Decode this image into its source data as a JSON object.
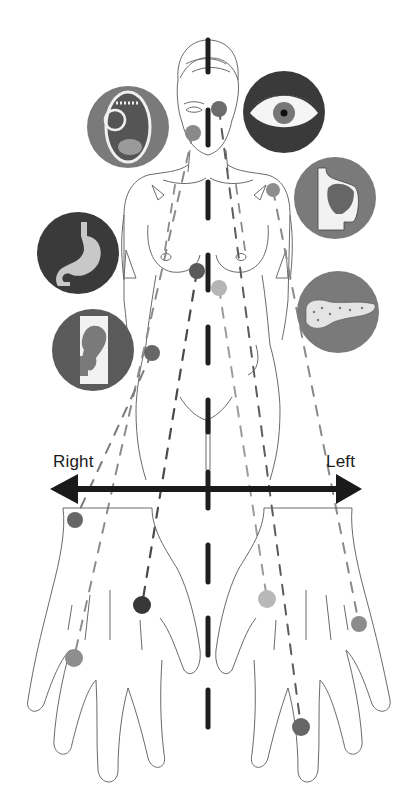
{
  "diagram": {
    "title": "",
    "axis": {
      "left_label": "Right",
      "right_label": "Left"
    },
    "colors": {
      "line": "#555555",
      "midline": "#1e1e1e",
      "arrow": "#1a1a1a",
      "dot_dark": "#474747",
      "dot_mid": "#7e7e7e",
      "dot_light": "#b5b5b5",
      "circle_dark": "#3a3a3a",
      "circle_mid": "#7a7a7a",
      "organ_light": "#c8c8c8"
    },
    "organ_icons": [
      {
        "name": "mouth",
        "icon": "mouth-icon",
        "cx": 128,
        "cy": 127,
        "r": 41,
        "fill": "#7a7a7a"
      },
      {
        "name": "eye",
        "icon": "eye-icon",
        "cx": 284,
        "cy": 112,
        "r": 41,
        "fill": "#3a3a3a"
      },
      {
        "name": "liver",
        "icon": "liver-icon",
        "cx": 335,
        "cy": 198,
        "r": 41,
        "fill": "#7a7a7a"
      },
      {
        "name": "stomach",
        "icon": "stomach-icon",
        "cx": 78,
        "cy": 253,
        "r": 41,
        "fill": "#3a3a3a"
      },
      {
        "name": "pancreas",
        "icon": "pancreas-icon",
        "cx": 338,
        "cy": 312,
        "r": 41,
        "fill": "#7a7a7a"
      },
      {
        "name": "hip-joint",
        "icon": "hip-joint-icon",
        "cx": 93,
        "cy": 350,
        "r": 41,
        "fill": "#5a5a5a"
      }
    ],
    "body_points": [
      {
        "id": "eye-point",
        "cx": 219,
        "cy": 109,
        "r": 8,
        "fill": "#6c6c6c"
      },
      {
        "id": "mouth-point",
        "cx": 193,
        "cy": 133,
        "r": 8,
        "fill": "#8a8a8a"
      },
      {
        "id": "liver-point",
        "cx": 273,
        "cy": 190,
        "r": 7,
        "fill": "#8e8e8e"
      },
      {
        "id": "stomach-point",
        "cx": 197,
        "cy": 271,
        "r": 8,
        "fill": "#5a5a5a"
      },
      {
        "id": "pancreas-point",
        "cx": 219,
        "cy": 288,
        "r": 8,
        "fill": "#b5b5b5"
      },
      {
        "id": "hip-point",
        "cx": 152,
        "cy": 353,
        "r": 8,
        "fill": "#666666"
      }
    ],
    "hand_points": [
      {
        "id": "right-hand-wrist-point",
        "cx": 75,
        "cy": 520,
        "r": 8,
        "fill": "#666666"
      },
      {
        "id": "right-hand-palm-point",
        "cx": 142,
        "cy": 605,
        "r": 9,
        "fill": "#383838"
      },
      {
        "id": "right-hand-finger-point",
        "cx": 74,
        "cy": 658,
        "r": 9,
        "fill": "#8e8e8e"
      },
      {
        "id": "left-hand-thumb-point",
        "cx": 267,
        "cy": 599,
        "r": 9,
        "fill": "#b8b8b8"
      },
      {
        "id": "left-hand-edge-point",
        "cx": 359,
        "cy": 624,
        "r": 8,
        "fill": "#8c8c8c"
      },
      {
        "id": "left-hand-middle-finger-point",
        "cx": 301,
        "cy": 727,
        "r": 9,
        "fill": "#666666"
      }
    ]
  }
}
